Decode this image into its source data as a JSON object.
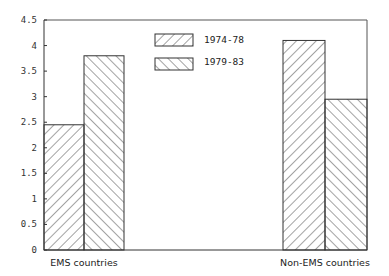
{
  "chart_data": {
    "type": "bar",
    "title": "",
    "xlabel": "",
    "ylabel": "",
    "categories": [
      "EMS countries",
      "Non-EMS countries"
    ],
    "series": [
      {
        "name": "1974-78",
        "pattern": "forward-diagonal-hatch",
        "values": [
          2.45,
          4.1
        ]
      },
      {
        "name": "1979-83",
        "pattern": "backward-diagonal-hatch",
        "values": [
          3.8,
          2.95
        ]
      }
    ],
    "ylim": [
      0,
      4.5
    ],
    "yticks": [
      "0",
      "0.5",
      "1",
      "1.5",
      "2",
      "2.5",
      "3",
      "3.5",
      "4",
      "4.5"
    ],
    "grid": false,
    "legend_position": "top-center-inside"
  },
  "legend": {
    "items": [
      {
        "label": "1974-78"
      },
      {
        "label": "1979-83"
      }
    ]
  },
  "colors": {
    "ink": "#333333",
    "background": "#ffffff"
  }
}
